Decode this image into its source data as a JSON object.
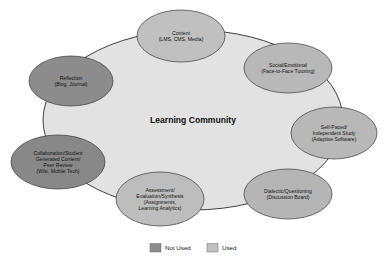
{
  "diagram": {
    "center": {
      "label": "Learning Community",
      "fill": "#e2e2e2"
    },
    "nodes": [
      {
        "id": "content",
        "lines": [
          "Content",
          "(LMS, CMS, Media)"
        ],
        "status": "Used",
        "fill": "#c0c0c0",
        "cx": 181,
        "cy": 36,
        "rx": 44,
        "ry": 26
      },
      {
        "id": "social-emotional",
        "lines": [
          "Social/Emotional",
          "(Face-to-Face Tutoring)"
        ],
        "status": "Used",
        "fill": "#b8b8b8",
        "cx": 288,
        "cy": 68,
        "rx": 44,
        "ry": 25
      },
      {
        "id": "self-paced",
        "lines": [
          "Self-Paced/",
          "Independent Study",
          "(Adaptive Software)"
        ],
        "status": "Used",
        "fill": "#b8b8b8",
        "cx": 334,
        "cy": 133,
        "rx": 43,
        "ry": 26
      },
      {
        "id": "dialectic",
        "lines": [
          "Dialectic/Questioning",
          "(Discussion Board)"
        ],
        "status": "Used",
        "fill": "#b5b5b5",
        "cx": 288,
        "cy": 194,
        "rx": 44,
        "ry": 25
      },
      {
        "id": "assessment",
        "lines": [
          "Assessment/",
          "Evaluation/Synthesis",
          "(Assignments,",
          "Learning Analytics)"
        ],
        "status": "Used",
        "fill": "#bdbdbd",
        "cx": 160,
        "cy": 199,
        "rx": 44,
        "ry": 27
      },
      {
        "id": "collaboration",
        "lines": [
          "Collaboration/Student",
          "Generated Content/",
          "Peer Review",
          "(Wiki, Mobile Tech)"
        ],
        "status": "Not Used",
        "fill": "#888888",
        "cx": 58,
        "cy": 162,
        "rx": 47,
        "ry": 27
      },
      {
        "id": "reflection",
        "lines": [
          "Reflection",
          "(Blog, Journal)"
        ],
        "status": "Not Used",
        "fill": "#8c8c8c",
        "cx": 71,
        "cy": 81,
        "rx": 42,
        "ry": 25
      }
    ]
  },
  "legend": {
    "items": [
      {
        "label": "Not Used",
        "color": "#8c8c8c"
      },
      {
        "label": "Used",
        "color": "#c0c0c0"
      }
    ]
  }
}
